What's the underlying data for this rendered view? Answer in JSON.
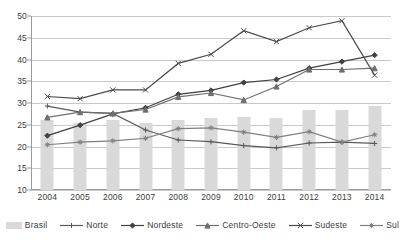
{
  "chart_data": {
    "type": "line",
    "title": "",
    "subtitle": "",
    "xlabel": "",
    "ylabel": "",
    "categories": [
      "2004",
      "2005",
      "2006",
      "2007",
      "2008",
      "2009",
      "2010",
      "2011",
      "2012",
      "2013",
      "2014"
    ],
    "ylim": [
      10,
      50
    ],
    "ytick_step": 5,
    "yticks": [
      "50",
      "45",
      "40",
      "35",
      "30",
      "25",
      "20",
      "15",
      "10"
    ],
    "grid": true,
    "legend_position": "bottom",
    "series": [
      {
        "name": "Brasil",
        "render": "bar",
        "marker": "none",
        "color": "#d9d9d9",
        "values": [
          26.1,
          25.5,
          26.0,
          25.4,
          26.0,
          26.6,
          26.8,
          26.5,
          28.5,
          28.5,
          29.2
        ]
      },
      {
        "name": "Norte",
        "render": "line",
        "marker": "plus",
        "color": "#595959",
        "values": [
          29.3,
          27.9,
          27.6,
          23.8,
          21.5,
          21.1,
          20.2,
          19.7,
          20.8,
          21.0,
          20.7
        ]
      },
      {
        "name": "Nordeste",
        "render": "line",
        "marker": "diamond",
        "color": "#404040",
        "values": [
          22.5,
          24.9,
          27.5,
          28.9,
          32.0,
          32.9,
          34.7,
          35.4,
          38.0,
          39.5,
          41.0
        ]
      },
      {
        "name": "Centro-Oeste",
        "render": "line",
        "marker": "triangle",
        "color": "#6e6e6e",
        "values": [
          26.7,
          27.9,
          27.6,
          28.5,
          31.4,
          32.3,
          30.7,
          33.8,
          37.7,
          37.7,
          38.0
        ]
      },
      {
        "name": "Sudeste",
        "render": "line",
        "marker": "x",
        "color": "#4a4a4a",
        "values": [
          31.5,
          31.0,
          33.0,
          33.0,
          39.1,
          41.2,
          46.6,
          44.1,
          47.3,
          48.9,
          36.4
        ]
      },
      {
        "name": "Sul",
        "render": "line",
        "marker": "asterisk",
        "color": "#808080",
        "values": [
          20.4,
          21.0,
          21.3,
          21.9,
          24.1,
          24.3,
          23.3,
          22.1,
          23.4,
          21.0,
          22.7
        ]
      }
    ]
  },
  "legend": {
    "items": [
      {
        "label": "Brasil"
      },
      {
        "label": "Norte"
      },
      {
        "label": "Nordeste"
      },
      {
        "label": "Centro-Oeste"
      },
      {
        "label": "Sudeste"
      },
      {
        "label": "Sul"
      }
    ]
  }
}
